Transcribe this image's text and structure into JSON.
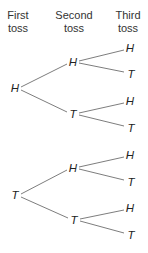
{
  "headers": {
    "first": [
      "First",
      "toss"
    ],
    "second": [
      "Second",
      "toss"
    ],
    "third": [
      "Third",
      "toss"
    ]
  },
  "tree": {
    "level1": [
      {
        "label": "H",
        "x": 15,
        "y": 88
      },
      {
        "label": "T",
        "x": 15,
        "y": 195
      }
    ],
    "level2": [
      {
        "label": "H",
        "x": 73,
        "y": 62
      },
      {
        "label": "T",
        "x": 73,
        "y": 114
      },
      {
        "label": "H",
        "x": 73,
        "y": 168
      },
      {
        "label": "T",
        "x": 74,
        "y": 220
      }
    ],
    "level3": [
      {
        "label": "H",
        "x": 130,
        "y": 48
      },
      {
        "label": "T",
        "x": 131,
        "y": 74
      },
      {
        "label": "H",
        "x": 130,
        "y": 101
      },
      {
        "label": "T",
        "x": 131,
        "y": 128
      },
      {
        "label": "H",
        "x": 130,
        "y": 155
      },
      {
        "label": "T",
        "x": 131,
        "y": 182
      },
      {
        "label": "H",
        "x": 130,
        "y": 208
      },
      {
        "label": "T",
        "x": 131,
        "y": 235
      }
    ]
  },
  "colors": {
    "line": "#6e6e6e",
    "text": "#222222"
  }
}
